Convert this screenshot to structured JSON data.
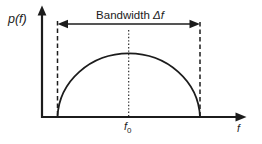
{
  "diagram": {
    "y_axis_label": "p(f)",
    "bandwidth": {
      "prefix": "Bandwidth ",
      "symbol": "Δf"
    },
    "center_frequency": {
      "base": "f",
      "subscript": "0"
    },
    "x_axis_label": "f",
    "colors": {
      "ink": "#1c1c1c",
      "background": "#ffffff"
    }
  }
}
